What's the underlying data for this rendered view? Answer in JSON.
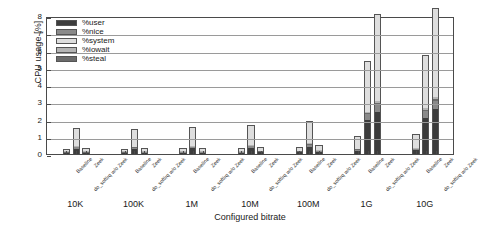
{
  "chart_data": {
    "type": "bar",
    "subtype": "stacked-grouped-bar",
    "title": "",
    "xlabel": "Configured bitrate",
    "ylabel": "CPU usage [%]",
    "ylim": [
      0,
      8
    ],
    "yticks": [
      0,
      1,
      2,
      3,
      4,
      5,
      6,
      7,
      8
    ],
    "ytick_labels": [
      "0",
      "1",
      "2",
      "3",
      "4",
      "5",
      "6",
      "7",
      "8"
    ],
    "grid": true,
    "grid_axis": "y",
    "legend_position": "upper-left-inside",
    "categories": [
      "10K",
      "100K",
      "1M",
      "10M",
      "100M",
      "1G",
      "10G"
    ],
    "subcategories": [
      "Baseline",
      "do_softirq w/o Zeek",
      "Zeek"
    ],
    "series": [
      {
        "name": "%user",
        "color": "#3d3d3d",
        "values": [
          [
            0.05,
            0.3,
            0.05
          ],
          [
            0.05,
            0.28,
            0.06
          ],
          [
            0.06,
            0.32,
            0.07
          ],
          [
            0.07,
            0.35,
            0.1
          ],
          [
            0.1,
            0.42,
            0.12
          ],
          [
            0.18,
            1.95,
            2.45
          ],
          [
            0.22,
            2.1,
            2.6
          ]
        ]
      },
      {
        "name": "%nice",
        "color": "#8a8a8a",
        "values": [
          [
            0.02,
            0.08,
            0.02
          ],
          [
            0.02,
            0.07,
            0.02
          ],
          [
            0.02,
            0.08,
            0.02
          ],
          [
            0.03,
            0.09,
            0.03
          ],
          [
            0.03,
            0.1,
            0.03
          ],
          [
            0.05,
            0.35,
            0.45
          ],
          [
            0.06,
            0.4,
            0.5
          ]
        ]
      },
      {
        "name": "%system",
        "color": "#dedede",
        "values": [
          [
            0.15,
            1.05,
            0.18
          ],
          [
            0.15,
            1.0,
            0.18
          ],
          [
            0.17,
            1.08,
            0.2
          ],
          [
            0.18,
            1.15,
            0.22
          ],
          [
            0.22,
            1.3,
            0.3
          ],
          [
            0.75,
            2.95,
            5.0
          ],
          [
            0.8,
            3.05,
            5.15
          ]
        ]
      },
      {
        "name": "%iowait",
        "color": "#b5b5b5",
        "values": [
          [
            0.02,
            0.05,
            0.02
          ],
          [
            0.02,
            0.05,
            0.02
          ],
          [
            0.02,
            0.05,
            0.02
          ],
          [
            0.02,
            0.06,
            0.02
          ],
          [
            0.03,
            0.06,
            0.03
          ],
          [
            0.04,
            0.1,
            0.12
          ],
          [
            0.04,
            0.12,
            0.14
          ]
        ]
      },
      {
        "name": "%steal",
        "color": "#6b6b6b",
        "values": [
          [
            0.01,
            0.02,
            0.01
          ],
          [
            0.01,
            0.02,
            0.01
          ],
          [
            0.01,
            0.02,
            0.01
          ],
          [
            0.01,
            0.02,
            0.01
          ],
          [
            0.01,
            0.02,
            0.01
          ],
          [
            0.02,
            0.05,
            0.08
          ],
          [
            0.02,
            0.05,
            0.09
          ]
        ]
      }
    ],
    "totals": [
      [
        0.25,
        1.5,
        0.28
      ],
      [
        0.25,
        1.42,
        0.29
      ],
      [
        0.28,
        1.55,
        0.32
      ],
      [
        0.31,
        1.67,
        0.38
      ],
      [
        0.39,
        1.9,
        0.49
      ],
      [
        1.04,
        5.4,
        8.1
      ],
      [
        1.14,
        5.72,
        8.48
      ]
    ]
  },
  "legend": {
    "items": [
      {
        "label": "%user",
        "color": "#3d3d3d"
      },
      {
        "label": "%nice",
        "color": "#8a8a8a"
      },
      {
        "label": "%system",
        "color": "#dedede"
      },
      {
        "label": "%iowait",
        "color": "#b5b5b5"
      },
      {
        "label": "%steal",
        "color": "#6b6b6b"
      }
    ]
  }
}
